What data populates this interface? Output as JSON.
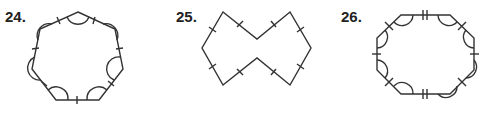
{
  "problems": [
    {
      "number": "24.",
      "shape": "regular heptagon",
      "marks": "all sides single tick, all angles single arc"
    },
    {
      "number": "25.",
      "shape": "concave octagon (bowtie)",
      "marks": "all sides single tick"
    },
    {
      "number": "26.",
      "shape": "octagon",
      "marks": "top and bottom sides double tick, other sides single tick, all angles single arc"
    }
  ],
  "colors": {
    "stroke": "#333333",
    "text": "#222222"
  }
}
